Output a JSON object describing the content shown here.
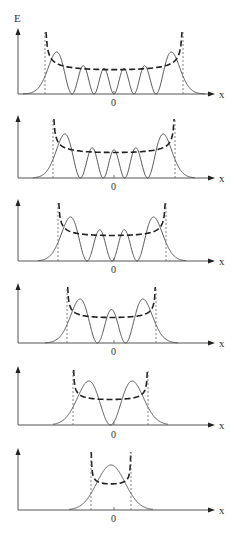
{
  "figure": {
    "y_axis_label": "E",
    "x_axis_label": "x",
    "origin_label": "0",
    "colors": {
      "axis": "#555555",
      "wavefunction": "#444444",
      "classical_probability": "#222222",
      "turning_line": "#666666"
    },
    "panels": [
      {
        "n": 5,
        "top": 28,
        "baseline": 94,
        "zero_label_y": 106,
        "x_left": 45,
        "x_right": 183,
        "tail": 22,
        "amp": 42,
        "show_E": true
      },
      {
        "n": 4,
        "top": 115,
        "baseline": 178,
        "zero_label_y": 190,
        "x_left": 53,
        "x_right": 175,
        "tail": 20,
        "amp": 44,
        "show_E": false
      },
      {
        "n": 3,
        "top": 199,
        "baseline": 261,
        "zero_label_y": 273,
        "x_left": 58,
        "x_right": 166,
        "tail": 20,
        "amp": 44,
        "show_E": false
      },
      {
        "n": 2,
        "top": 283,
        "baseline": 343,
        "zero_label_y": 355,
        "x_left": 67,
        "x_right": 156,
        "tail": 22,
        "amp": 44,
        "show_E": false
      },
      {
        "n": 1,
        "top": 366,
        "baseline": 425,
        "zero_label_y": 438,
        "x_left": 73,
        "x_right": 148,
        "tail": 20,
        "amp": 44,
        "show_E": false
      },
      {
        "n": 0,
        "top": 448,
        "baseline": 510,
        "zero_label_y": 522,
        "x_left": 91,
        "x_right": 131,
        "tail": 22,
        "amp": 45,
        "show_E": false
      }
    ],
    "axis_x_start": 18,
    "axis_x_end": 215,
    "center_x": 114
  }
}
